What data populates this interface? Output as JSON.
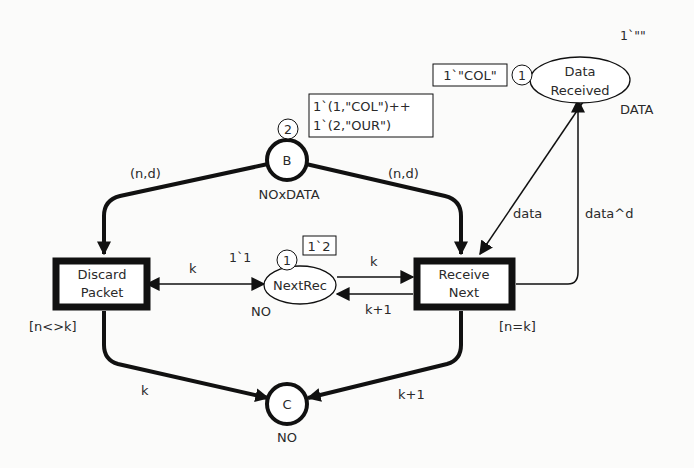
{
  "places": {
    "B": {
      "name": "B",
      "colorset": "NOxDATA",
      "token_count": "2",
      "marking": [
        "1`(1,\"COL\")++",
        "1`(2,\"OUR\")"
      ]
    },
    "NextRec": {
      "name": "NextRec",
      "colorset": "NO",
      "initial": "1`1",
      "token_count": "1",
      "marking": "1`2"
    },
    "C": {
      "name": "C",
      "colorset": "NO"
    },
    "DataReceived": {
      "name_line1": "Data",
      "name_line2": "Received",
      "colorset": "DATA",
      "initial": "1`\"\"",
      "token_count": "1",
      "marking": "1`\"COL\""
    }
  },
  "transitions": {
    "DiscardPacket": {
      "line1": "Discard",
      "line2": "Packet",
      "guard": "[n<>k]"
    },
    "ReceiveNext": {
      "line1": "Receive",
      "line2": "Next",
      "guard": "[n=k]"
    }
  },
  "arcs": {
    "b_to_discard": "(n,d)",
    "b_to_receive": "(n,d)",
    "discard_nextrec": "k",
    "nextrec_to_receive": "k",
    "receive_to_nextrec": "k+1",
    "datarec_to_receive": "data",
    "receive_to_datarec": "data^d",
    "discard_to_c": "k",
    "receive_to_c": "k+1"
  }
}
